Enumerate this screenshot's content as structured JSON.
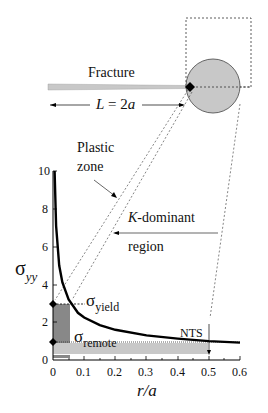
{
  "labels": {
    "fracture": "Fracture",
    "length": "L = 2a",
    "length_var": "L",
    "length_eq": " = 2",
    "length_a": "a",
    "plastic_zone_1": "Plastic",
    "plastic_zone_2": "zone",
    "k_dominant_k": "K",
    "k_dominant_1": "-dominant",
    "k_dominant_2": "region",
    "sigma": "σ",
    "sigma_yy_sub": "yy",
    "sigma_yield_sub": "yield",
    "sigma_remote_sub": "remote",
    "nts": "NTS",
    "xlabel": "r/a"
  },
  "colors": {
    "circle_fill": "#c8c8c8",
    "plastic_shade": "#888888",
    "remote_shade": "#c8c8c8",
    "curve": "#000000"
  },
  "chart_data": {
    "type": "line",
    "title": "",
    "xlabel": "r/a",
    "ylabel": "σyy",
    "xlim": [
      0,
      0.6
    ],
    "ylim": [
      0,
      10
    ],
    "xticks": [
      "0",
      "0.1",
      "0.2",
      "0.3",
      "0.4",
      "0.5",
      "0.6"
    ],
    "yticks": [
      "0",
      "2",
      "4",
      "6",
      "8",
      "10"
    ],
    "series": [
      {
        "name": "σyy (K-field)",
        "x": [
          0.005,
          0.01,
          0.02,
          0.03,
          0.05,
          0.08,
          0.1,
          0.15,
          0.2,
          0.3,
          0.4,
          0.5,
          0.6
        ],
        "y": [
          10.0,
          7.1,
          5.0,
          4.1,
          3.2,
          2.5,
          2.25,
          1.84,
          1.6,
          1.3,
          1.13,
          1.0,
          0.92
        ]
      }
    ],
    "annotations": [
      {
        "text": "σyield",
        "y": 3.0,
        "x_end": 0.06
      },
      {
        "text": "σremote",
        "y": 1.0
      },
      {
        "text": "NTS",
        "x": 0.5
      }
    ],
    "grid": false
  }
}
